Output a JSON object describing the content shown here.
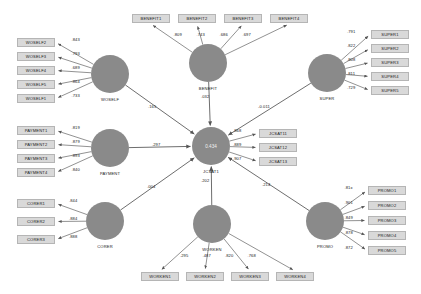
{
  "diagram": {
    "type": "sem-path-diagram",
    "title": "",
    "endogenous_r2": "0.434",
    "endogenous_label": "JCSAT1"
  },
  "constructs": [
    {
      "id": "woself",
      "label": "WOSELF",
      "cx": 110,
      "cy": 74,
      "r": 19,
      "label_x": 110,
      "label_y": 97,
      "indicator_side": "left",
      "indicators": [
        {
          "name": "WOSELF2",
          "loading": ".843",
          "bx": 17,
          "by": 38
        },
        {
          "name": "WOSELF3",
          "loading": ".793",
          "bx": 17,
          "by": 52
        },
        {
          "name": "WOSELF4",
          "loading": ".689",
          "bx": 17,
          "by": 66
        },
        {
          "name": "WOSELF5",
          "loading": ".864",
          "bx": 17,
          "by": 80
        },
        {
          "name": "WOSELF1",
          "loading": ".733",
          "bx": 17,
          "by": 94
        }
      ]
    },
    {
      "id": "benefit",
      "label": "BENEFIT",
      "cx": 208,
      "cy": 63,
      "r": 19,
      "label_x": 208,
      "label_y": 86,
      "indicator_side": "top",
      "indicators": [
        {
          "name": "BENEFIT1",
          "loading": ".809",
          "bx": 132,
          "by": 14
        },
        {
          "name": "BENEFIT2",
          "loading": ".743",
          "bx": 178,
          "by": 14
        },
        {
          "name": "BENEFIT3",
          "loading": ".686",
          "bx": 224,
          "by": 14
        },
        {
          "name": "BENEFIT4",
          "loading": ".697",
          "bx": 270,
          "by": 14
        }
      ]
    },
    {
      "id": "super",
      "label": "SUPER",
      "cx": 327,
      "cy": 73,
      "r": 19,
      "label_x": 327,
      "label_y": 96,
      "indicator_side": "right",
      "indicators": [
        {
          "name": "SUPER1",
          "loading": ".791",
          "bx": 371,
          "by": 30
        },
        {
          "name": "SUPER2",
          "loading": ".822",
          "bx": 371,
          "by": 44
        },
        {
          "name": "SUPER3",
          "loading": ".808",
          "bx": 371,
          "by": 58
        },
        {
          "name": "SUPER4",
          "loading": ".811",
          "bx": 371,
          "by": 72
        },
        {
          "name": "SUPER5",
          "loading": ".729",
          "bx": 371,
          "by": 86
        }
      ]
    },
    {
      "id": "payment",
      "label": "PAYMENT",
      "cx": 110,
      "cy": 148,
      "r": 19,
      "label_x": 110,
      "label_y": 171,
      "indicator_side": "left",
      "indicators": [
        {
          "name": "PAYMENT1",
          "loading": ".819",
          "bx": 17,
          "by": 126
        },
        {
          "name": "PAYMENT2",
          "loading": ".879",
          "bx": 17,
          "by": 140
        },
        {
          "name": "PAYMENT3",
          "loading": ".893",
          "bx": 17,
          "by": 154
        },
        {
          "name": "PAYMENT4",
          "loading": ".840",
          "bx": 17,
          "by": 168
        }
      ]
    },
    {
      "id": "corer",
      "label": "CORER",
      "cx": 105,
      "cy": 221,
      "r": 19,
      "label_x": 105,
      "label_y": 244,
      "indicator_side": "left",
      "indicators": [
        {
          "name": "CORER1",
          "loading": ".844",
          "bx": 17,
          "by": 199
        },
        {
          "name": "CORER2",
          "loading": ".884",
          "bx": 17,
          "by": 217
        },
        {
          "name": "CORER3",
          "loading": ".888",
          "bx": 17,
          "by": 235
        }
      ]
    },
    {
      "id": "worken",
      "label": "WORKEN",
      "cx": 212,
      "cy": 224,
      "r": 19,
      "label_x": 212,
      "label_y": 247,
      "indicator_side": "bottom",
      "indicators": [
        {
          "name": "WORKEN1",
          "loading": ".295",
          "bx": 141,
          "by": 272
        },
        {
          "name": "WORKEN2",
          "loading": ".487",
          "bx": 186,
          "by": 272
        },
        {
          "name": "WORKEN3",
          "loading": ".820",
          "bx": 231,
          "by": 272
        },
        {
          "name": "WORKEN4",
          "loading": ".768",
          "bx": 276,
          "by": 272
        }
      ]
    },
    {
      "id": "promo",
      "label": "PROMO",
      "cx": 325,
      "cy": 221,
      "r": 19,
      "label_x": 325,
      "label_y": 244,
      "indicator_side": "right",
      "indicators": [
        {
          "name": "PROMO1",
          "loading": ".81x",
          "bx": 368,
          "by": 186
        },
        {
          "name": "PROMO2",
          "loading": ".901",
          "bx": 368,
          "by": 201
        },
        {
          "name": "PROMO3",
          "loading": ".849",
          "bx": 368,
          "by": 216
        },
        {
          "name": "PROMO4",
          "loading": ".878",
          "bx": 368,
          "by": 231
        },
        {
          "name": "PROMO5",
          "loading": ".872",
          "bx": 368,
          "by": 246
        }
      ]
    }
  ],
  "endogenous": {
    "id": "jcsat",
    "label": "JCSAT1",
    "r2": "0.434",
    "cx": 211,
    "cy": 146,
    "r": 19,
    "label_x": 211,
    "label_y": 169,
    "indicators": [
      {
        "name": "JCSAT11",
        "loading": ".868",
        "bx": 259,
        "by": 129
      },
      {
        "name": "JCSAT12",
        "loading": ".889",
        "bx": 259,
        "by": 143
      },
      {
        "name": "JCSAT13",
        "loading": ".907",
        "bx": 259,
        "by": 157
      }
    ]
  },
  "structural_paths": [
    {
      "from": "WOSELF",
      "to": "JCSAT1",
      "coef": ".165",
      "lx": 148,
      "ly": 104
    },
    {
      "from": "BENEFIT",
      "to": "JCSAT1",
      "coef": ".032",
      "lx": 201,
      "ly": 94
    },
    {
      "from": "SUPER",
      "to": "JCSAT1",
      "coef": "-0.011",
      "lx": 258,
      "ly": 104
    },
    {
      "from": "PAYMENT",
      "to": "JCSAT1",
      "coef": ".297",
      "lx": 152,
      "ly": 142
    },
    {
      "from": "CORER",
      "to": "JCSAT1",
      "coef": ".004",
      "lx": 147,
      "ly": 184
    },
    {
      "from": "WORKEN",
      "to": "JCSAT1",
      "coef": ".202",
      "lx": 201,
      "ly": 178
    },
    {
      "from": "PROMO",
      "to": "JCSAT1",
      "coef": ".214",
      "lx": 262,
      "ly": 182
    }
  ],
  "colors": {
    "construct_fill": "#8a8a8a",
    "indicator_fill": "#d9d9d9",
    "indicator_border": "#b5b5b5",
    "path_stroke": "#6e6e6e",
    "text": "#1a1a1a",
    "background": "#ffffff"
  }
}
